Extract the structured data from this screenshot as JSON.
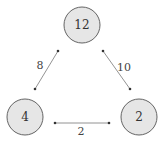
{
  "diagram": {
    "type": "triangle-graph",
    "nodes": [
      {
        "id": "top",
        "label": "12",
        "cx": 82,
        "cy": 25,
        "r": 18
      },
      {
        "id": "bottom-left",
        "label": "4",
        "cx": 25,
        "cy": 117,
        "r": 18
      },
      {
        "id": "bottom-right",
        "label": "2",
        "cx": 139,
        "cy": 117,
        "r": 18
      }
    ],
    "edges": [
      {
        "from": "top",
        "to": "bottom-left",
        "label": "8",
        "x1": 58,
        "y1": 51,
        "x2": 35,
        "y2": 89,
        "lx": 40,
        "ly": 65
      },
      {
        "from": "top",
        "to": "bottom-right",
        "label": "10",
        "x1": 103,
        "y1": 51,
        "x2": 130,
        "y2": 89,
        "lx": 124,
        "ly": 67
      },
      {
        "from": "bottom-left",
        "to": "bottom-right",
        "label": "2",
        "x1": 55,
        "y1": 123,
        "x2": 109,
        "y2": 123,
        "lx": 81,
        "ly": 130
      }
    ],
    "colors": {
      "node_fill": "#e6e6e6",
      "node_stroke": "#555555",
      "edge": "#777777"
    }
  }
}
